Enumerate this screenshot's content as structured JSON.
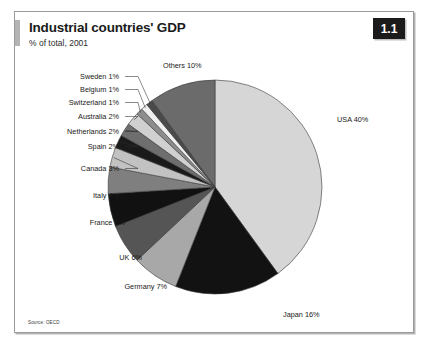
{
  "figure": {
    "number": "1.1",
    "title": "Industrial countries' GDP",
    "subtitle": "% of total, 2001",
    "source": "Source: OECD"
  },
  "chart_data": {
    "type": "pie",
    "title": "Industrial countries' GDP",
    "subtitle": "% of total, 2001",
    "unit": "% of total",
    "year": 2001,
    "start_angle_deg": 0,
    "direction": "clockwise",
    "legend": "none",
    "labels_position": "outside-with-leader-lines",
    "categories": [
      "USA",
      "Japan",
      "Germany",
      "UK",
      "France",
      "Italy",
      "Canada",
      "Spain",
      "Netherlands",
      "Australia",
      "Switzerland",
      "Belgium",
      "Sweden",
      "Others"
    ],
    "values": [
      40,
      16,
      7,
      6,
      5,
      4,
      3,
      2,
      2,
      2,
      1,
      1,
      1,
      10
    ],
    "slice_labels": [
      "USA 40%",
      "Japan 16%",
      "Germany 7%",
      "UK 6%",
      "France 5%",
      "Italy 4%",
      "Canada 3%",
      "Spain 2%",
      "Netherlands 2%",
      "Australia 2%",
      "Switzerland 1%",
      "Belgium 1%",
      "Sweden 1%",
      "Others 10%"
    ],
    "slice_colors": [
      "#d6d6d6",
      "#121212",
      "#a8a8a8",
      "#555555",
      "#111111",
      "#7f7f7f",
      "#c2c2c2",
      "#1a1a1a",
      "#6e6e6e",
      "#d0d0d0",
      "#8d8d8d",
      "#efefef",
      "#4a4a4a",
      "#6b6b6b"
    ]
  },
  "colors": {
    "frame_border": "#9a9a9a",
    "badge_background": "#1b1b1b",
    "badge_text": "#ffffff",
    "title_tick": "#b4b4b4",
    "pie_outline": "#3a3a3a",
    "background": "#ffffff"
  }
}
